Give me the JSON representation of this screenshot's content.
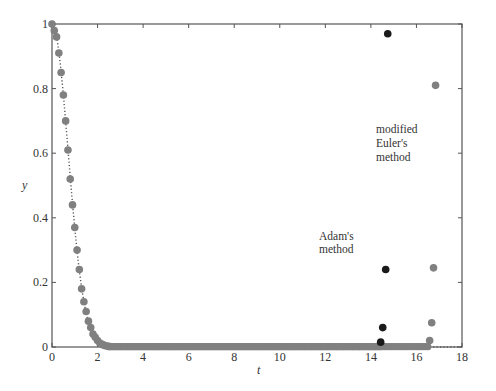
{
  "chart_data": {
    "type": "scatter",
    "title": "",
    "xlabel": "t",
    "ylabel": "y",
    "xlim": [
      0,
      18
    ],
    "ylim": [
      0,
      1
    ],
    "xticks": [
      0,
      2,
      4,
      6,
      8,
      10,
      12,
      14,
      16,
      18
    ],
    "yticks": [
      0,
      0.2,
      0.4,
      0.6,
      0.8,
      1
    ],
    "ytick_labels": [
      "0",
      "0.2",
      "0.4",
      "0.6",
      "0.8",
      "1"
    ],
    "grid": false,
    "legend": null,
    "exact_curve": {
      "name": "exact solution",
      "style": "dotted",
      "color": "#555555",
      "description": "y = exp(-t^2) style decay from 1 toward 0, staying at 0 to t=18"
    },
    "series": [
      {
        "name": "Adam's method",
        "color": "#1a1a1a",
        "points": [
          [
            14.43,
            0.015
          ],
          [
            14.52,
            0.06
          ],
          [
            14.65,
            0.24
          ],
          [
            14.74,
            0.97
          ]
        ]
      },
      {
        "name": "modified Euler's method",
        "color": "#808080",
        "points": [
          [
            0.0,
            1.0
          ],
          [
            0.1,
            0.98
          ],
          [
            0.2,
            0.96
          ],
          [
            0.3,
            0.91
          ],
          [
            0.4,
            0.85
          ],
          [
            0.5,
            0.78
          ],
          [
            0.6,
            0.7
          ],
          [
            0.7,
            0.61
          ],
          [
            0.8,
            0.52
          ],
          [
            0.9,
            0.44
          ],
          [
            1.0,
            0.37
          ],
          [
            1.1,
            0.3
          ],
          [
            1.2,
            0.24
          ],
          [
            1.3,
            0.18
          ],
          [
            1.4,
            0.14
          ],
          [
            1.5,
            0.11
          ],
          [
            1.6,
            0.08
          ],
          [
            1.7,
            0.06
          ],
          [
            1.8,
            0.04
          ],
          [
            1.9,
            0.03
          ],
          [
            2.0,
            0.02
          ],
          [
            2.1,
            0.012
          ],
          [
            2.2,
            0.008
          ],
          [
            2.3,
            0.005
          ],
          [
            2.4,
            0.003
          ],
          [
            2.5,
            0.002
          ],
          [
            16.58,
            0.02
          ],
          [
            16.67,
            0.075
          ],
          [
            16.75,
            0.245
          ],
          [
            16.84,
            0.81
          ]
        ]
      }
    ],
    "annotations": [
      {
        "text_lines": [
          "modified",
          "Euler's",
          "method"
        ],
        "x": 14.2,
        "y": 0.66
      },
      {
        "text_lines": [
          "Adam's",
          "method"
        ],
        "x": 11.7,
        "y": 0.32
      }
    ]
  },
  "labels": {
    "xlabel": "t",
    "ylabel": "y",
    "annot_euler": [
      "modified",
      "Euler's",
      "method"
    ],
    "annot_adams": [
      "Adam's",
      "method"
    ]
  }
}
